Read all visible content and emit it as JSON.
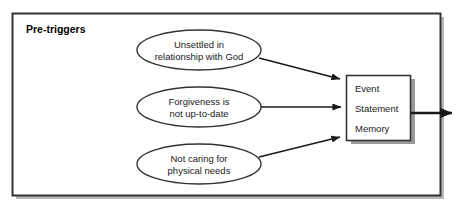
{
  "diagram": {
    "frame": {
      "title": "Pre-triggers",
      "border_color": "#333333",
      "background_color": "#ffffff",
      "shadow_color": "#aaaaaa"
    },
    "ellipses": [
      {
        "id": "unsettled",
        "line1": "Unsettled in",
        "line2": "relationship with God",
        "stroke": "#333333",
        "fill": "#ffffff"
      },
      {
        "id": "forgiveness",
        "line1": "Forgiveness is",
        "line2": "not up-to-date",
        "stroke": "#333333",
        "fill": "#ffffff"
      },
      {
        "id": "physical-needs",
        "line1": "Not caring for",
        "line2": "physical needs",
        "stroke": "#333333",
        "fill": "#ffffff"
      }
    ],
    "target_box": {
      "id": "event-statement-memory",
      "lines": [
        "Event",
        "Statement",
        "Memory"
      ],
      "stroke": "#333333",
      "fill": "#ffffff",
      "shadow_color": "#808080"
    },
    "arrows": {
      "color": "#1a1a1a",
      "count": 4,
      "labels": [
        "unsettled-to-box",
        "forgiveness-to-box",
        "physical-needs-to-box",
        "box-outgoing"
      ]
    }
  }
}
